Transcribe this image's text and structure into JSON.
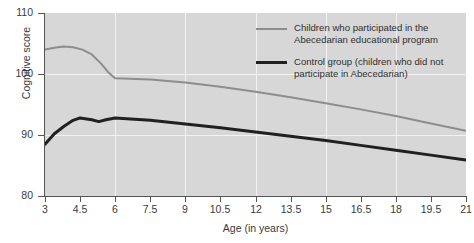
{
  "chart_data": {
    "type": "line",
    "title": "",
    "xlabel": "Age (in years)",
    "ylabel": "Cognitive score",
    "xlim": [
      3,
      21
    ],
    "ylim": [
      80,
      110
    ],
    "xticks": [
      "3",
      "4.5",
      "6",
      "7.5",
      "9",
      "10.5",
      "12",
      "13.5",
      "15",
      "16.5",
      "18",
      "19.5",
      "21"
    ],
    "xtick_values": [
      3,
      4.5,
      6,
      7.5,
      9,
      10.5,
      12,
      13.5,
      15,
      16.5,
      18,
      19.5,
      21
    ],
    "yticks": [
      "80",
      "90",
      "100",
      "110"
    ],
    "ytick_values": [
      80,
      90,
      100,
      110
    ],
    "grid": "both, white gridlines on gray panel",
    "legend_position": "upper right inside plot",
    "plot_background": "#d7d7d7",
    "series": [
      {
        "name": "Children who participated in the Abecedarian educational program",
        "color": "#8d8d8d",
        "width": 2,
        "x": [
          3,
          3.4,
          3.8,
          4.2,
          4.6,
          5.0,
          5.4,
          5.7,
          6.0,
          7.5,
          9,
          10.5,
          12,
          13.5,
          15,
          16.5,
          18,
          19.5,
          21
        ],
        "y": [
          104.0,
          104.3,
          104.5,
          104.4,
          104.0,
          103.2,
          101.7,
          100.3,
          99.3,
          99.1,
          98.6,
          97.9,
          97.1,
          96.2,
          95.2,
          94.2,
          93.1,
          91.9,
          90.7
        ]
      },
      {
        "name": "Control group (children who did not participate in Abecedarian)",
        "color": "#202020",
        "width": 3,
        "x": [
          3,
          3.4,
          3.8,
          4.2,
          4.5,
          5.0,
          5.3,
          5.6,
          6.0,
          7.5,
          9,
          10.5,
          12,
          13.5,
          15,
          16.5,
          18,
          19.5,
          21
        ],
        "y": [
          88.5,
          90.2,
          91.4,
          92.4,
          92.8,
          92.5,
          92.2,
          92.5,
          92.8,
          92.4,
          91.8,
          91.2,
          90.5,
          89.8,
          89.1,
          88.3,
          87.5,
          86.7,
          85.9
        ]
      }
    ]
  },
  "legend": {
    "entries": [
      {
        "label": "Children who participated in the Abecedarian educational program",
        "style": "thin"
      },
      {
        "label": "Control group (children who did not participate in Abecedarian)",
        "style": "thick"
      }
    ]
  },
  "axes": {
    "x_title": "Age (in years)",
    "y_title": "Cognitive score"
  }
}
